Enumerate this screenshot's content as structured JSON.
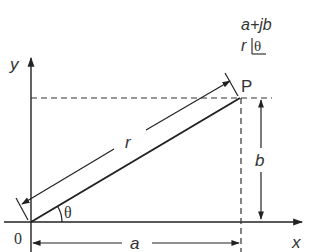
{
  "diagram": {
    "type": "phasor-complex-plane",
    "colors": {
      "line": "#222222",
      "text": "#333333",
      "background": "#ffffff"
    },
    "axes": {
      "x_label": "x",
      "y_label": "y",
      "origin_label": "0"
    },
    "point": {
      "label": "P"
    },
    "dimensions": {
      "magnitude_label": "r",
      "horizontal_label": "a",
      "vertical_label": "b",
      "angle_label": "θ"
    },
    "notation": {
      "rectangular": "a+jb",
      "polar_r": "r",
      "polar_angle": "θ"
    }
  }
}
